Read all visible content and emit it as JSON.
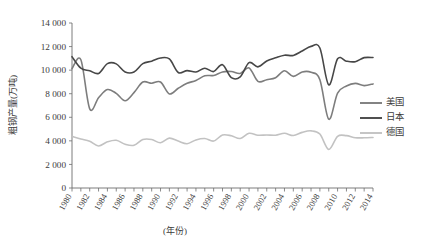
{
  "chart_data": {
    "type": "line",
    "title": "",
    "xlabel": "(年份)",
    "ylabel": "粗钢产量(万吨)",
    "ylim": [
      0,
      14000
    ],
    "ytick_step": 2000,
    "yticks": [
      "0",
      "2 000",
      "4 000",
      "6 000",
      "8 000",
      "10 000",
      "12 000",
      "14 000"
    ],
    "xlim": [
      1980,
      2014
    ],
    "xticks": [
      "1980",
      "1981",
      "1982",
      "1983",
      "1984",
      "1985",
      "1986",
      "1987",
      "1988",
      "1989",
      "1990",
      "1991",
      "1992",
      "1993",
      "1994",
      "1995",
      "1996",
      "1997",
      "1998",
      "1999",
      "2000",
      "2001",
      "2002",
      "2003",
      "2004",
      "2005",
      "2006",
      "2007",
      "2008",
      "2009",
      "2010",
      "2011",
      "2012",
      "2013",
      "2014"
    ],
    "xtick_labels_shown": [
      "1980",
      "1982",
      "1984",
      "1986",
      "1988",
      "1990",
      "1992",
      "1994",
      "1996",
      "1998",
      "2000",
      "2002",
      "2004",
      "2006",
      "2008",
      "2010",
      "2012",
      "2014"
    ],
    "grid": false,
    "legend_position": "right",
    "x": [
      1980,
      1981,
      1982,
      1983,
      1984,
      1985,
      1986,
      1987,
      1988,
      1989,
      1990,
      1991,
      1992,
      1993,
      1994,
      1995,
      1996,
      1997,
      1998,
      1999,
      2000,
      2001,
      2002,
      2003,
      2004,
      2005,
      2006,
      2007,
      2008,
      2009,
      2010,
      2011,
      2012,
      2013,
      2014
    ],
    "series": [
      {
        "name": "美国",
        "color": "#7d7d7d",
        "values": [
          10130,
          10880,
          6720,
          7660,
          8350,
          8030,
          7400,
          8090,
          8990,
          8890,
          8990,
          7980,
          8460,
          8880,
          9120,
          9520,
          9550,
          9850,
          9880,
          9720,
          10190,
          9050,
          9190,
          9360,
          9950,
          9470,
          9850,
          9820,
          9190,
          5840,
          8050,
          8660,
          8880,
          8690,
          8830
        ]
      },
      {
        "name": "日本",
        "color": "#474747",
        "values": [
          11140,
          10170,
          9950,
          9720,
          10550,
          10530,
          9850,
          9840,
          10550,
          10760,
          11030,
          10950,
          9800,
          9960,
          9840,
          10160,
          9880,
          10460,
          9360,
          9430,
          10640,
          10280,
          10780,
          11050,
          11270,
          11250,
          11620,
          12020,
          11880,
          8750,
          10960,
          10760,
          10720,
          11060,
          11070
        ]
      },
      {
        "name": "德国",
        "color": "#c2c2c2",
        "values": [
          4380,
          4160,
          3960,
          3570,
          3920,
          4050,
          3710,
          3620,
          4110,
          4110,
          3840,
          4230,
          3980,
          3760,
          4080,
          4200,
          3980,
          4500,
          4430,
          4200,
          4640,
          4480,
          4500,
          4480,
          4640,
          4450,
          4720,
          4850,
          4580,
          3270,
          4390,
          4440,
          4270,
          4260,
          4290
        ]
      }
    ]
  },
  "legend": {
    "items": [
      {
        "label": "美国"
      },
      {
        "label": "日本"
      },
      {
        "label": "德国"
      }
    ]
  }
}
